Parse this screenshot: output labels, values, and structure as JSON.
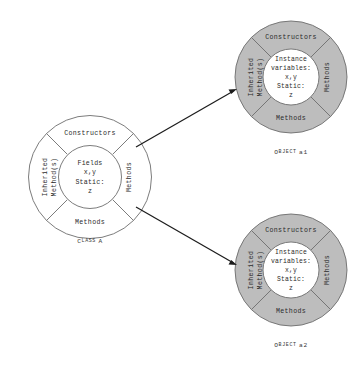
{
  "diagram": {
    "background_color": "#ffffff",
    "line_color": "#6d6d6d",
    "arrow_color": "#1c1c1c",
    "object_ring_color": "#bdbdbd",
    "class_ring_color": "#ffffff",
    "core_color": "#ffffff"
  },
  "class_node": {
    "caption_prefix": "C",
    "caption_rest": "LASS",
    "caption_name": "A",
    "caption_full": "CLASS A",
    "segments": {
      "top": "Constructors",
      "right": "Methods",
      "bottom": "Methods",
      "left_line1": "Inherited",
      "left_line2": "Method(s)"
    },
    "core": {
      "line1": "Fields",
      "line2": "x,y",
      "line3": "Static:",
      "line4": "z"
    }
  },
  "object_nodes": [
    {
      "id": "object-a1",
      "caption_prefix": "O",
      "caption_rest": "BJECT",
      "caption_name": "a1",
      "caption_full": "OBJECT a1",
      "segments": {
        "top": "Constructors",
        "right": "Methods",
        "bottom": "Methods",
        "left_line1": "Inherited",
        "left_line2": "Method(s)"
      },
      "core": {
        "line1": "Instance",
        "line2": "variables:",
        "line3": "x,y",
        "line4": "Static:",
        "line5": "z"
      }
    },
    {
      "id": "object-a2",
      "caption_prefix": "O",
      "caption_rest": "BJECT",
      "caption_name": "a2",
      "caption_full": "OBJECT a2",
      "segments": {
        "top": "Constructors",
        "right": "Methods",
        "bottom": "Methods",
        "left_line1": "Inherited",
        "left_line2": "Method(s)"
      },
      "core": {
        "line1": "Instance",
        "line2": "variables:",
        "line3": "x,y",
        "line4": "Static:",
        "line5": "z"
      }
    }
  ],
  "connectors": [
    {
      "id": "arrow-class-to-a1",
      "from": "class-a",
      "to": "object-a1"
    },
    {
      "id": "arrow-class-to-a2",
      "from": "class-a",
      "to": "object-a2"
    }
  ]
}
